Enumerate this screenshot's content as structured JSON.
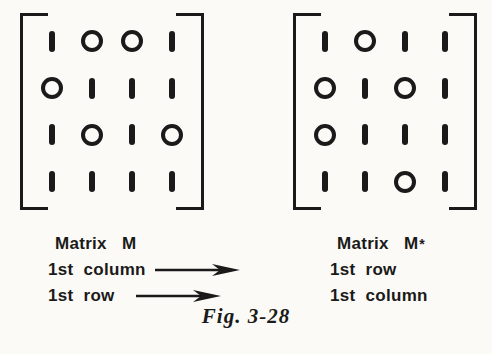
{
  "page": {
    "ink_color": "#1a1a1a",
    "paper_color": "#fcfaf6",
    "caption": "Fig. 3-28"
  },
  "glyph_legend": {
    "one": "vertical-bar",
    "zero": "circle"
  },
  "left_matrix": {
    "name": "Matrix M",
    "rows": [
      [
        1,
        0,
        0,
        1
      ],
      [
        0,
        1,
        1,
        1
      ],
      [
        1,
        0,
        1,
        0
      ],
      [
        1,
        1,
        1,
        1
      ]
    ],
    "labels": [
      {
        "text": "1st column",
        "arrow": "right-arrow"
      },
      {
        "text": "1st row",
        "arrow": "right-arrow"
      }
    ]
  },
  "right_matrix": {
    "name": "Matrix M",
    "sup": "*",
    "rows": [
      [
        1,
        0,
        1,
        1
      ],
      [
        0,
        1,
        0,
        1
      ],
      [
        0,
        1,
        1,
        1
      ],
      [
        1,
        1,
        0,
        1
      ]
    ],
    "labels": [
      {
        "text": "1st row"
      },
      {
        "text": "1st column"
      }
    ]
  }
}
